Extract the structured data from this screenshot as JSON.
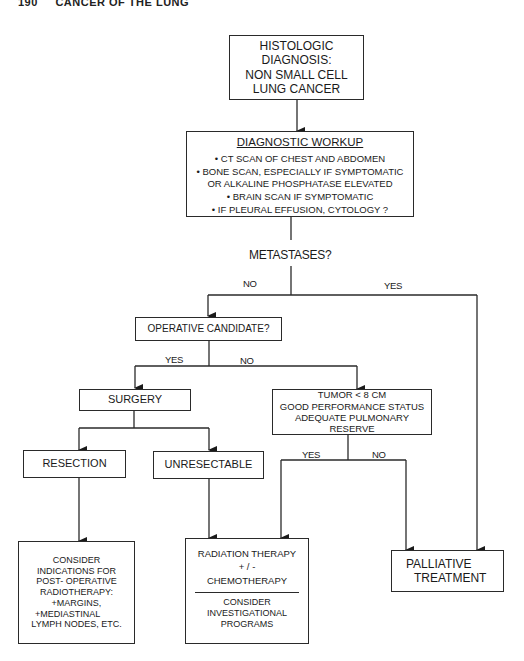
{
  "page_header": {
    "page_number": "190",
    "title": "CANCER OF THE LUNG"
  },
  "flowchart": {
    "diagnosis": {
      "lines": [
        "HISTOLOGIC DIAGNOSIS:",
        "NON SMALL CELL",
        "LUNG CANCER"
      ]
    },
    "workup": {
      "title": "DIAGNOSTIC WORKUP",
      "items": [
        "• CT SCAN OF CHEST AND ABDOMEN",
        "• BONE SCAN, ESPECIALLY IF SYMPTOMATIC",
        "OR ALKALINE PHOSPHATASE ELEVATED",
        "• BRAIN SCAN IF SYMPTOMATIC",
        "• IF PLEURAL EFFUSION, CYTOLOGY ?"
      ]
    },
    "metastases_question": "METASTASES?",
    "metastases_no": "NO",
    "metastases_yes": "YES",
    "operative_candidate": "OPERATIVE CANDIDATE?",
    "operative_yes": "YES",
    "operative_no": "NO",
    "surgery": "SURGERY",
    "criteria": {
      "lines": [
        "TUMOR < 8 CM",
        "GOOD PERFORMANCE STATUS",
        "ADEQUATE PULMONARY RESERVE"
      ]
    },
    "criteria_yes": "YES",
    "criteria_no": "NO",
    "resection": "RESECTION",
    "unresectable": "UNRESECTABLE",
    "postop": {
      "lines": [
        "CONSIDER",
        "INDICATIONS FOR",
        "POST- OPERATIVE",
        "RADIOTHERAPY:",
        "+MARGINS,",
        "+MEDIASTINAL",
        "LYMPH NODES, ETC."
      ]
    },
    "radiation": {
      "lines": [
        "RADIATION THERAPY",
        "+ / -",
        "CHEMOTHERAPY"
      ],
      "sub_lines": [
        "CONSIDER",
        "INVESTIGATIONAL",
        "PROGRAMS"
      ]
    },
    "palliative": {
      "lines": [
        "PALLIATIVE",
        "TREATMENT"
      ]
    }
  }
}
